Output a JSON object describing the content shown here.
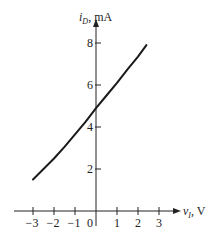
{
  "chart_data": {
    "type": "line",
    "title": "",
    "xlabel": "v_I, V",
    "ylabel": "i_D, mA",
    "xlim": [
      -3.3,
      3.8
    ],
    "ylim": [
      0,
      9
    ],
    "grid": false,
    "legend": null,
    "x_ticks": [
      -3,
      -2,
      -1,
      0,
      1,
      2,
      3
    ],
    "x_tick_labels": [
      "−3",
      "−2",
      "−1",
      "0",
      "1",
      "2",
      "3"
    ],
    "y_ticks": [
      2,
      4,
      6,
      8
    ],
    "y_tick_labels": [
      "2",
      "4",
      "6",
      "8"
    ],
    "series": [
      {
        "name": "i_D vs v_I",
        "x": [
          -3,
          -2.5,
          -2,
          -1.5,
          -1,
          -0.5,
          0,
          0.5,
          1,
          1.5,
          2,
          2.4
        ],
        "y": [
          1.5,
          2.0,
          2.5,
          3.05,
          3.65,
          4.25,
          4.9,
          5.5,
          6.1,
          6.75,
          7.35,
          7.9
        ]
      }
    ]
  },
  "labels": {
    "y_axis_main": "i",
    "y_axis_sub": "D",
    "y_axis_unit": ", mA",
    "x_axis_main": "v",
    "x_axis_sub": "I",
    "x_axis_unit": ", V"
  }
}
